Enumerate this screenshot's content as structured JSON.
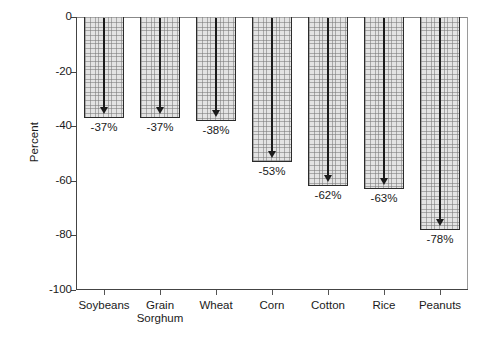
{
  "chart_data": {
    "type": "bar",
    "title": "",
    "xlabel": "",
    "ylabel": "Percent",
    "categories": [
      "Soybeans",
      "Grain\nSorghum",
      "Wheat",
      "Corn",
      "Cotton",
      "Rice",
      "Peanuts"
    ],
    "values": [
      -37,
      -37,
      -38,
      -53,
      -62,
      -63,
      -78
    ],
    "data_labels": [
      "-37%",
      "-37%",
      "-38%",
      "-53%",
      "-62%",
      "-63%",
      "-78%"
    ],
    "ylim": [
      -100,
      0
    ],
    "yticks": [
      0,
      -20,
      -40,
      -60,
      -80,
      -100
    ],
    "ytick_labels": [
      "0",
      "-20",
      "-40",
      "-60",
      "-80",
      "-100"
    ],
    "grid": false,
    "legend": "none",
    "bar_fill": "#e3e3e3",
    "bar_edge": "#2b2b2b",
    "annotation_style": "downward-arrow-inside-bar"
  }
}
